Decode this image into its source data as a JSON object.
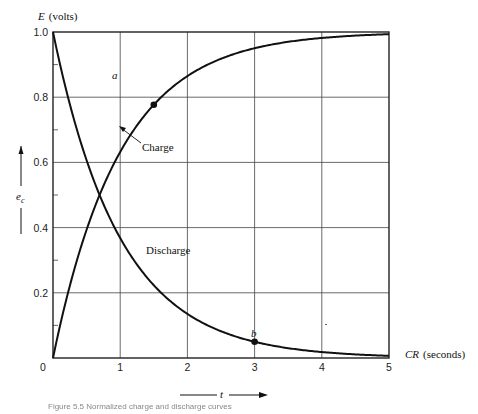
{
  "chart_data": {
    "type": "line",
    "title": "",
    "ylabel": "E (volts)",
    "xlabel": "CR (seconds)",
    "side_label": "e_c",
    "bottom_arrow_label": "t",
    "xlim": [
      0,
      5
    ],
    "ylim": [
      0,
      1.0
    ],
    "x_ticks": [
      "0",
      "1",
      "2",
      "3",
      "4",
      "5"
    ],
    "y_ticks": [
      "0.2",
      "0.4",
      "0.6",
      "0.8",
      "1.0"
    ],
    "grid": true,
    "series": [
      {
        "name": "Charge",
        "formula": "1 - exp(-t)",
        "x": [
          0,
          0.5,
          1,
          1.5,
          2,
          2.5,
          3,
          3.5,
          4,
          4.5,
          5
        ],
        "values": [
          0,
          0.393,
          0.632,
          0.777,
          0.865,
          0.918,
          0.95,
          0.97,
          0.982,
          0.989,
          0.993
        ]
      },
      {
        "name": "Discharge",
        "formula": "exp(-t)",
        "x": [
          0,
          0.5,
          1,
          1.5,
          2,
          2.5,
          3,
          3.5,
          4,
          4.5,
          5
        ],
        "values": [
          1.0,
          0.607,
          0.368,
          0.223,
          0.135,
          0.082,
          0.05,
          0.03,
          0.018,
          0.011,
          0.007
        ]
      }
    ],
    "annotations": [
      {
        "label": "a",
        "x": 1.5,
        "y": 0.777,
        "series": "Charge"
      },
      {
        "label": "b",
        "x": 3.0,
        "y": 0.05,
        "series": "Discharge"
      },
      {
        "label": "Charge",
        "x": 1.3,
        "y": 0.62
      },
      {
        "label": "Discharge",
        "x": 1.3,
        "y": 0.36
      }
    ]
  },
  "labels": {
    "y_axis_E": "E",
    "y_axis_units": "(volts)",
    "x_axis_CR": "CR",
    "x_axis_units": "(seconds)",
    "e_c": "e",
    "e_c_sub": "c",
    "t": "t",
    "a": "a",
    "b": "b",
    "charge": "Charge",
    "discharge": "Discharge",
    "zero": "0"
  },
  "caption": "Figure 5.5  Normalized charge and discharge curves"
}
